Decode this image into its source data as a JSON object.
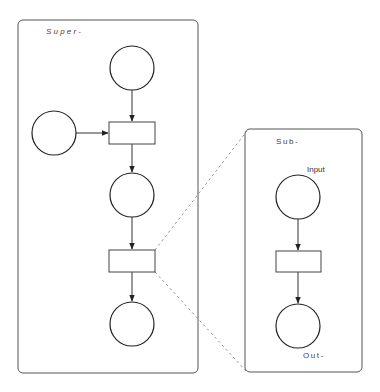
{
  "diagram": {
    "type": "petri-net-hierarchy",
    "colors": {
      "stroke": "#222222",
      "box_stroke": "#555555",
      "dashed": "#999999",
      "background": "#ffffff"
    },
    "super_net": {
      "label": "Super-",
      "places": [
        "top-place",
        "left-place",
        "middle-place",
        "bottom-place"
      ],
      "transitions": [
        "upper-transition",
        "lower-transition"
      ]
    },
    "sub_net": {
      "label": "Sub-",
      "input_label": "Input",
      "output_label": "Out-",
      "places": [
        "input-place",
        "output-place"
      ],
      "transitions": [
        "sub-transition"
      ]
    },
    "refinement": "lower-transition is refined into Sub- net (dashed zoom lines)"
  }
}
